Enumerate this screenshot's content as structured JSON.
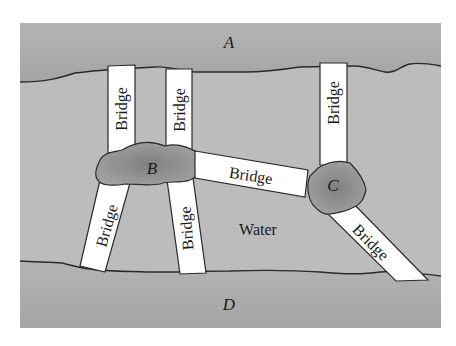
{
  "diagram": {
    "colors": {
      "background": "#ffffff",
      "water": "#b9b9b9",
      "land_banks": "#aaaaaa",
      "islands": "#8f8f8f",
      "bridge": "#ffffff",
      "outline": "#2a2a2a"
    },
    "land_masses": {
      "A": "A",
      "B": "B",
      "C": "C",
      "D": "D"
    },
    "water_label": "Water",
    "bridges": [
      {
        "id": 1,
        "label": "Bridge",
        "connects": [
          "A",
          "B"
        ]
      },
      {
        "id": 2,
        "label": "Bridge",
        "connects": [
          "A",
          "B"
        ]
      },
      {
        "id": 3,
        "label": "Bridge",
        "connects": [
          "A",
          "C"
        ]
      },
      {
        "id": 4,
        "label": "Bridge",
        "connects": [
          "B",
          "C"
        ]
      },
      {
        "id": 5,
        "label": "Bridge",
        "connects": [
          "B",
          "D"
        ]
      },
      {
        "id": 6,
        "label": "Bridge",
        "connects": [
          "B",
          "D"
        ]
      },
      {
        "id": 7,
        "label": "Bridge",
        "connects": [
          "C",
          "D"
        ]
      }
    ]
  }
}
